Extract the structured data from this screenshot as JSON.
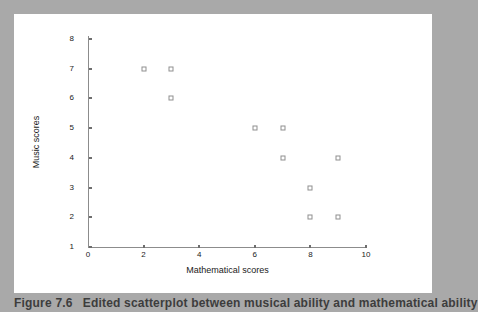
{
  "figure": {
    "caption_number": "Figure 7.6",
    "caption_text": "Edited scatterplot between musical ability and mathematical ability"
  },
  "colors": {
    "page_background": "#a9a9a9",
    "panel_background": "#ffffff",
    "axis": "#8c8c8c",
    "marker_border": "#8f8f8f",
    "text": "#1a1a1a",
    "caption": "#3d3d3d"
  },
  "chart_data": {
    "type": "scatter",
    "title": "",
    "xlabel": "Mathematical scores",
    "ylabel": "Music scores",
    "xlim": [
      0,
      10
    ],
    "ylim": [
      1,
      8
    ],
    "xticks": [
      0,
      2,
      4,
      6,
      8,
      10
    ],
    "yticks": [
      1,
      2,
      3,
      4,
      5,
      6,
      7,
      8
    ],
    "origin_label": "0",
    "grid": false,
    "legend": null,
    "marker": "open-square",
    "points": [
      {
        "x": 2,
        "y": 7
      },
      {
        "x": 3,
        "y": 7
      },
      {
        "x": 3,
        "y": 6
      },
      {
        "x": 6,
        "y": 5
      },
      {
        "x": 7,
        "y": 5
      },
      {
        "x": 7,
        "y": 4
      },
      {
        "x": 9,
        "y": 4
      },
      {
        "x": 8,
        "y": 3
      },
      {
        "x": 8,
        "y": 2
      },
      {
        "x": 9,
        "y": 2
      }
    ]
  }
}
